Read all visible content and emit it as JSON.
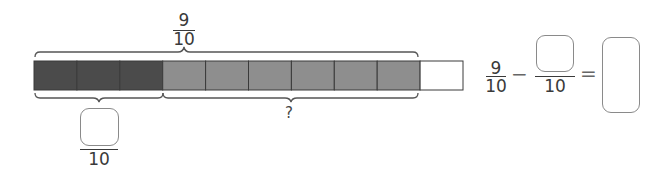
{
  "diagram": {
    "bar": {
      "total_cells": 10,
      "cells": [
        {
          "state": "dark"
        },
        {
          "state": "dark"
        },
        {
          "state": "dark"
        },
        {
          "state": "light"
        },
        {
          "state": "light"
        },
        {
          "state": "light"
        },
        {
          "state": "light"
        },
        {
          "state": "light"
        },
        {
          "state": "light"
        },
        {
          "state": "empty"
        }
      ],
      "colors": {
        "dark": "#4b4b4b",
        "light": "#8e8e8e",
        "empty": "#ffffff",
        "border": "#3a3a3a"
      }
    },
    "top_brace_label": {
      "numerator": "9",
      "denominator": "10"
    },
    "bottom_left_brace_label": {
      "numerator": "",
      "denominator": "10"
    },
    "bottom_right_brace_label": "?"
  },
  "equation": {
    "first_fraction": {
      "numerator": "9",
      "denominator": "10"
    },
    "operator": "−",
    "second_fraction": {
      "numerator": "",
      "denominator": "10"
    },
    "equals": "=",
    "answer": ""
  }
}
